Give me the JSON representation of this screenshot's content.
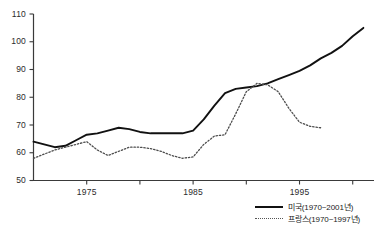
{
  "chart_data": {
    "type": "line",
    "title": "",
    "xlabel": "",
    "ylabel": "",
    "xlim": [
      1970,
      2002
    ],
    "ylim": [
      50,
      110
    ],
    "grid": false,
    "legend_position": "bottom-right",
    "yticks": [
      50,
      60,
      70,
      80,
      90,
      100,
      110
    ],
    "xticks": [
      1975,
      1985,
      1995
    ],
    "xticks_minor": [
      1980,
      1990,
      2000
    ],
    "series": [
      {
        "name": "미국(1970~2001년)",
        "style": "solid",
        "color": "#111111",
        "x": [
          1970,
          1971,
          1972,
          1973,
          1974,
          1975,
          1976,
          1977,
          1978,
          1979,
          1980,
          1981,
          1982,
          1983,
          1984,
          1985,
          1986,
          1987,
          1988,
          1989,
          1990,
          1991,
          1992,
          1993,
          1994,
          1995,
          1996,
          1997,
          1998,
          1999,
          2000,
          2001
        ],
        "values": [
          64,
          63,
          62,
          62.5,
          64.5,
          66.5,
          67,
          68,
          69,
          68.5,
          67.5,
          67,
          67,
          67,
          67,
          68,
          72,
          77,
          81.5,
          83,
          83.5,
          84,
          85,
          86.5,
          88,
          89.5,
          91.5,
          94,
          96,
          98.5,
          102,
          105
        ]
      },
      {
        "name": "프랑스(1970~1997년)",
        "style": "dotted",
        "color": "#555555",
        "x": [
          1970,
          1971,
          1972,
          1973,
          1974,
          1975,
          1976,
          1977,
          1978,
          1979,
          1980,
          1981,
          1982,
          1983,
          1984,
          1985,
          1986,
          1987,
          1988,
          1989,
          1990,
          1991,
          1992,
          1993,
          1994,
          1995,
          1996,
          1997
        ],
        "values": [
          58,
          59.5,
          61,
          62,
          63,
          64,
          61,
          59,
          60.5,
          62,
          62,
          61.5,
          60.5,
          59,
          58,
          58.5,
          63,
          66,
          66.5,
          74,
          82,
          85,
          84.5,
          82,
          76,
          71,
          69.5,
          69
        ]
      }
    ]
  },
  "legend": {
    "entries": [
      {
        "label": "미국(1970~2001년)",
        "style": "solid"
      },
      {
        "label": "프랑스(1970~1997년)",
        "style": "dotted"
      }
    ]
  },
  "axis": {
    "y_tick_labels": [
      "110",
      "100",
      "90",
      "80",
      "70",
      "60",
      "50"
    ],
    "x_tick_labels": [
      "1975",
      "1985",
      "1995"
    ]
  }
}
